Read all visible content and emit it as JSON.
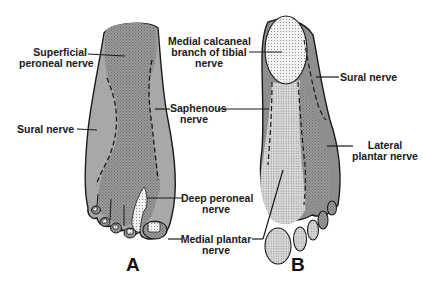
{
  "figure": {
    "panels": [
      {
        "id": "A",
        "letter": "A",
        "view": "dorsal"
      },
      {
        "id": "B",
        "letter": "B",
        "view": "plantar"
      }
    ],
    "labels": {
      "superficial_peroneal": [
        "Superficial",
        "peroneal nerve"
      ],
      "sural_a": "Sural nerve",
      "medial_calcaneal": [
        "Medial calcaneal",
        "branch of tibial",
        "nerve"
      ],
      "saphenous": [
        "Saphenous",
        "nerve"
      ],
      "sural_b": "Sural nerve",
      "lateral_plantar": [
        "Lateral",
        "plantar nerve"
      ],
      "deep_peroneal": [
        "Deep peroneal",
        "nerve"
      ],
      "medial_plantar": [
        "Medial plantar",
        "nerve"
      ]
    },
    "colors": {
      "dark_fill": "#8e8e8e",
      "mid_fill": "#a9a9a9",
      "light_fill": "#d6d6d6",
      "dotted_fill": "#ececec",
      "outline": "#1a1a1a"
    }
  }
}
